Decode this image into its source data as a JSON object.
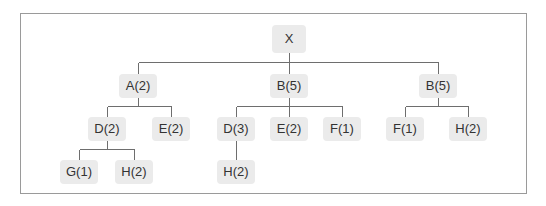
{
  "diagram": {
    "type": "tree",
    "colors": {
      "node_bg": "#ebebeb",
      "edge": "#6e6e6e",
      "frame": "#9a9a9a",
      "text": "#333333"
    },
    "root": {
      "label": "X",
      "children": [
        {
          "label": "A(2)",
          "children": [
            {
              "label": "D(2)",
              "children": [
                {
                  "label": "G(1)"
                },
                {
                  "label": "H(2)"
                }
              ]
            },
            {
              "label": "E(2)"
            }
          ]
        },
        {
          "label": "B(5)",
          "children": [
            {
              "label": "D(3)",
              "children": [
                {
                  "label": "H(2)"
                }
              ]
            },
            {
              "label": "E(2)"
            },
            {
              "label": "F(1)"
            }
          ]
        },
        {
          "label": "B(5)",
          "children": [
            {
              "label": "F(1)"
            },
            {
              "label": "H(2)"
            }
          ]
        }
      ]
    }
  },
  "nodes": {
    "x": "X",
    "a": "A(2)",
    "b1": "B(5)",
    "b2": "B(5)",
    "a_d": "D(2)",
    "a_e": "E(2)",
    "b1_d": "D(3)",
    "b1_e": "E(2)",
    "b1_f": "F(1)",
    "b2_f": "F(1)",
    "b2_h": "H(2)",
    "a_d_g": "G(1)",
    "a_d_h": "H(2)",
    "b1_d_h": "H(2)"
  }
}
